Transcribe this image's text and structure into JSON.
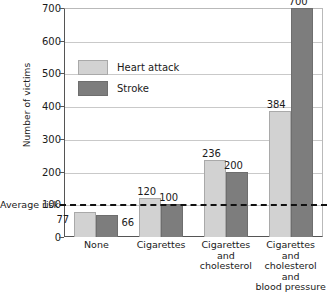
{
  "chart_data": {
    "type": "bar",
    "title": "",
    "xlabel": "",
    "ylabel": "Number of victims",
    "ylim": [
      0,
      700
    ],
    "ytick_labels": [
      "0",
      "100",
      "200",
      "300",
      "400",
      "500",
      "600",
      "700"
    ],
    "yticks": [
      0,
      100,
      200,
      300,
      400,
      500,
      600,
      700
    ],
    "grid": true,
    "legend_position": "upper-left-inside",
    "categories": [
      "None",
      "Cigarettes",
      "Cigarettes and cholesterol",
      "Cigarettes and cholesterol and blood pressure"
    ],
    "category_lines": [
      [
        "None"
      ],
      [
        "Cigarettes"
      ],
      [
        "Cigarettes",
        "and",
        "cholesterol"
      ],
      [
        "Cigarettes",
        "and",
        "cholesterol",
        "and",
        "blood pressure"
      ]
    ],
    "series": [
      {
        "name": "Heart attack",
        "color": "#d2d2d2",
        "values": [
          77,
          120,
          236,
          384
        ]
      },
      {
        "name": "Stroke",
        "color": "#7d7d7d",
        "values": [
          66,
          100,
          200,
          700
        ]
      }
    ],
    "annotations": [
      {
        "name": "average-risk",
        "label": "Average risk",
        "value": 100,
        "style": "dashed-horizontal-line",
        "color": "#111111"
      }
    ]
  },
  "labels": {
    "y_axis_title": "Number of victims",
    "average_risk": "Average risk"
  }
}
